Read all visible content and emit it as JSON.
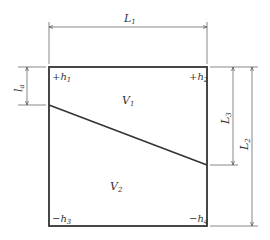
{
  "diagram": {
    "type": "earthwork-grid-square",
    "colors": {
      "stroke": "#333333",
      "dim_stroke": "#555555",
      "background": "#ffffff"
    },
    "dimensions": {
      "top": {
        "symbol": "L",
        "sub": "1"
      },
      "left": {
        "symbol": "l",
        "sub": "a"
      },
      "right_inner": {
        "symbol": "L",
        "sub": "3"
      },
      "right_outer": {
        "symbol": "L",
        "sub": "2"
      }
    },
    "corners": {
      "top_left": {
        "sign": "+",
        "symbol": "h",
        "sub": "1"
      },
      "top_right": {
        "sign": "+",
        "symbol": "h",
        "sub": "2"
      },
      "bottom_left": {
        "sign": "−",
        "symbol": "h",
        "sub": "3"
      },
      "bottom_right": {
        "sign": "−",
        "symbol": "h",
        "sub": "4"
      }
    },
    "regions": {
      "upper": {
        "symbol": "V",
        "sub": "1"
      },
      "lower": {
        "symbol": "V",
        "sub": "2"
      }
    }
  }
}
